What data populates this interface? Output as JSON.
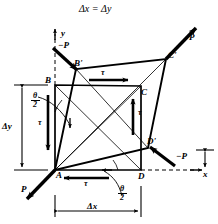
{
  "figure": {
    "title": "Δx = Δy",
    "type": "shear-deformation-diagram"
  },
  "axes": {
    "x_label": "x",
    "y_label": "y",
    "origin_point": "A",
    "x_axis_style": "dashed-with-arrow",
    "y_axis_style": "dashed-with-arrow"
  },
  "vertices": {
    "undeformed": [
      {
        "name": "A",
        "x": 55,
        "y": 170
      },
      {
        "name": "B",
        "x": 55,
        "y": 85
      },
      {
        "name": "C",
        "x": 141,
        "y": 86
      },
      {
        "name": "D",
        "x": 141,
        "y": 170
      }
    ],
    "deformed": [
      {
        "name": "A",
        "x": 55,
        "y": 170
      },
      {
        "name": "B'",
        "x": 76,
        "y": 69
      },
      {
        "name": "C'",
        "x": 166,
        "y": 59
      },
      {
        "name": "D'",
        "x": 148,
        "y": 148
      }
    ]
  },
  "labels": {
    "A": "A",
    "B": "B",
    "C": "C",
    "D": "D",
    "B_prime": "B'",
    "C_prime": "C'",
    "D_prime": "D'"
  },
  "forces": [
    {
      "name": "P",
      "label": "P",
      "position": "upper-right",
      "direction": "up-right",
      "sign": "positive"
    },
    {
      "name": "P",
      "label": "P",
      "position": "lower-left",
      "direction": "down-left",
      "sign": "positive"
    },
    {
      "name": "-P",
      "label": "−P",
      "position": "upper-left",
      "direction": "down-right",
      "sign": "negative"
    },
    {
      "name": "-P",
      "label": "−P",
      "position": "lower-right",
      "direction": "down-left",
      "sign": "negative"
    }
  ],
  "shear_stresses": [
    {
      "label": "τ",
      "position": "top",
      "direction": "right"
    },
    {
      "label": "τ",
      "position": "right",
      "direction": "up"
    },
    {
      "label": "τ",
      "position": "bottom",
      "direction": "left"
    },
    {
      "label": "τ",
      "position": "left",
      "direction": "down"
    }
  ],
  "angles": [
    {
      "numerator": "θ",
      "denominator": "2",
      "position": "upper-left",
      "full_label": "θ/2"
    },
    {
      "numerator": "θ",
      "denominator": "2",
      "position": "lower-right",
      "full_label": "θ/2"
    }
  ],
  "dimensions": [
    {
      "label": "Δy",
      "orientation": "vertical",
      "side": "left",
      "from": 85,
      "to": 170
    },
    {
      "label": "Δx",
      "orientation": "horizontal",
      "side": "bottom",
      "from": 55,
      "to": 141
    }
  ],
  "colors": {
    "line": "#000000",
    "background": "#ffffff",
    "thin_line": "#333333"
  }
}
